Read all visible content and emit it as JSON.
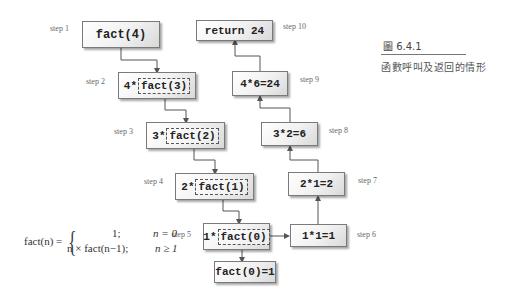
{
  "caption": {
    "figure_number": "圖 6.4.1",
    "title": "函數呼叫及返回的情形"
  },
  "formula": {
    "lhs": "fact(n) =",
    "case1_value": "1;",
    "case1_cond": "n = 0",
    "case2_value": "n × fact(n−1);",
    "case2_cond": "n ≥ 1"
  },
  "steps": {
    "s1": {
      "label": "step 1",
      "text": "fact(4)"
    },
    "s2": {
      "label": "step 2",
      "prefix": "4*",
      "call": "fact(3)"
    },
    "s3": {
      "label": "step 3",
      "prefix": "3*",
      "call": "fact(2)"
    },
    "s4": {
      "label": "step 4",
      "prefix": "2*",
      "call": "fact(1)"
    },
    "s5": {
      "label": "step 5",
      "prefix": "1*",
      "call": "fact(0)"
    },
    "base": {
      "text": "fact(0)=1"
    },
    "s6": {
      "label": "step 6",
      "text": "1*1=1"
    },
    "s7": {
      "label": "step 7",
      "text": "2*1=2"
    },
    "s8": {
      "label": "step 8",
      "text": "3*2=6"
    },
    "s9": {
      "label": "step 9",
      "text": "4*6=24"
    },
    "s10": {
      "label": "step 10",
      "text": "return 24"
    }
  },
  "colors": {
    "line": "#555555",
    "box_border": "#7a7a7a",
    "box_fill": "#f1f1f1"
  }
}
